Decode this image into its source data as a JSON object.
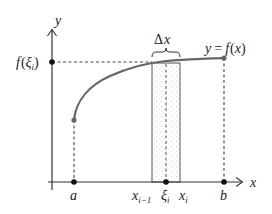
{
  "diagram": {
    "axes": {
      "x_label": "x",
      "y_label": "y"
    },
    "curve_label": {
      "lhs": "y",
      "eq": "=",
      "f": "f",
      "open": "(",
      "var": "x",
      "close": ")"
    },
    "delta_label": {
      "delta": "Δ",
      "var": "x"
    },
    "y_marker": {
      "f": "f",
      "open": "(",
      "xi": "ξ",
      "sub": "i",
      "close": ")"
    },
    "x_ticks": {
      "a": "a",
      "b": "b",
      "x_prev": {
        "base": "x",
        "sub": "i−1"
      },
      "xi": {
        "base": "ξ",
        "sub": "i"
      },
      "x_i": {
        "base": "x",
        "sub": "i"
      }
    },
    "colors": {
      "curve": "#666666",
      "axis": "#333333",
      "dash": "#444444",
      "rect_stroke": "#555555",
      "rect_fill_dots": "#999999"
    }
  }
}
